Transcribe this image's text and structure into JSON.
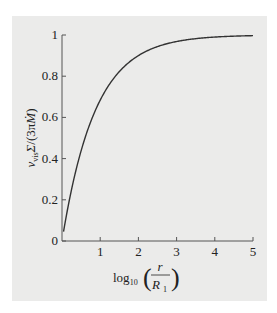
{
  "chart_data": {
    "type": "line",
    "title": "",
    "xlabel": "log10(r / R1)",
    "ylabel": "ν_vis Σ / (3π Ṁ)",
    "xlim": [
      0,
      5
    ],
    "ylim": [
      0,
      1
    ],
    "x_ticks": [
      "1",
      "2",
      "3",
      "4",
      "5"
    ],
    "y_ticks": [
      "0",
      "0.2",
      "0.4",
      "0.6",
      "0.8",
      "1"
    ],
    "grid": false,
    "legend": null,
    "series": [
      {
        "name": "1 - (R1/r)^(1/2)",
        "x": [
          0.04,
          0.1,
          0.2,
          0.3,
          0.4,
          0.5,
          0.6,
          0.8,
          1.0,
          1.2,
          1.5,
          1.8,
          2.0,
          2.5,
          3.0,
          3.5,
          4.0,
          4.5,
          5.0
        ],
        "y": [
          0.045,
          0.109,
          0.206,
          0.292,
          0.369,
          0.438,
          0.499,
          0.602,
          0.684,
          0.749,
          0.822,
          0.874,
          0.9,
          0.944,
          0.968,
          0.982,
          0.99,
          0.994,
          0.997
        ]
      }
    ]
  },
  "labels": {
    "x_title_main": "log",
    "x_title_sub": "10",
    "x_title_num": "r",
    "x_title_den": "R",
    "x_title_den_sub": "1",
    "y_title": "νvisΣ/(3πṀ)",
    "origin": "0"
  }
}
